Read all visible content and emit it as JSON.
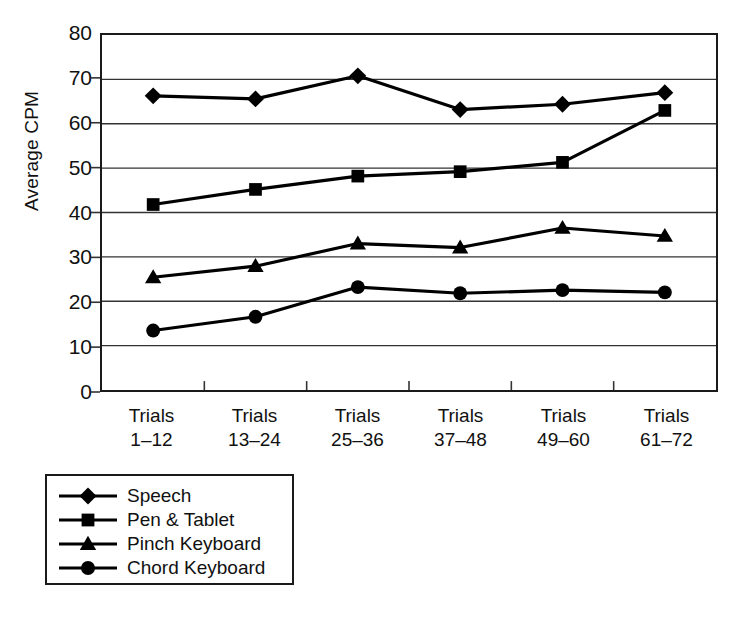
{
  "chart_data": {
    "type": "line",
    "title": "",
    "xlabel": "",
    "ylabel": "Average CPM",
    "ylim": [
      0,
      80
    ],
    "ytick_step": 10,
    "yticks": [
      80,
      70,
      60,
      50,
      40,
      30,
      20,
      10,
      0
    ],
    "grid": true,
    "legend_position": "below-left",
    "categories": [
      "Trials 1–12",
      "Trials 13–24",
      "Trials 25–36",
      "Trials 37–48",
      "Trials 49–60",
      "Trials 61–72"
    ],
    "category_lines": [
      {
        "line1": "Trials",
        "line2": "1–12"
      },
      {
        "line1": "Trials",
        "line2": "13–24"
      },
      {
        "line1": "Trials",
        "line2": "25–36"
      },
      {
        "line1": "Trials",
        "line2": "37–48"
      },
      {
        "line1": "Trials",
        "line2": "49–60"
      },
      {
        "line1": "Trials",
        "line2": "61–72"
      }
    ],
    "series": [
      {
        "name": "Speech",
        "marker": "diamond",
        "color": "#000000",
        "values": [
          66.3,
          65.6,
          70.8,
          63.2,
          64.4,
          67.0
        ]
      },
      {
        "name": "Pen & Tablet",
        "marker": "square",
        "color": "#000000",
        "values": [
          41.8,
          45.2,
          48.2,
          49.2,
          51.3,
          63.0
        ]
      },
      {
        "name": "Pinch Keyboard",
        "marker": "triangle",
        "color": "#000000",
        "values": [
          25.4,
          27.9,
          33.0,
          32.1,
          36.5,
          34.7
        ]
      },
      {
        "name": "Chord Keyboard",
        "marker": "circle",
        "color": "#000000",
        "values": [
          13.4,
          16.5,
          23.2,
          21.8,
          22.5,
          22.0
        ]
      }
    ]
  },
  "axis": {
    "y_title": "Average CPM"
  },
  "colors": {
    "ink": "#1a1a1a",
    "grid": "#333333",
    "background": "#ffffff"
  }
}
